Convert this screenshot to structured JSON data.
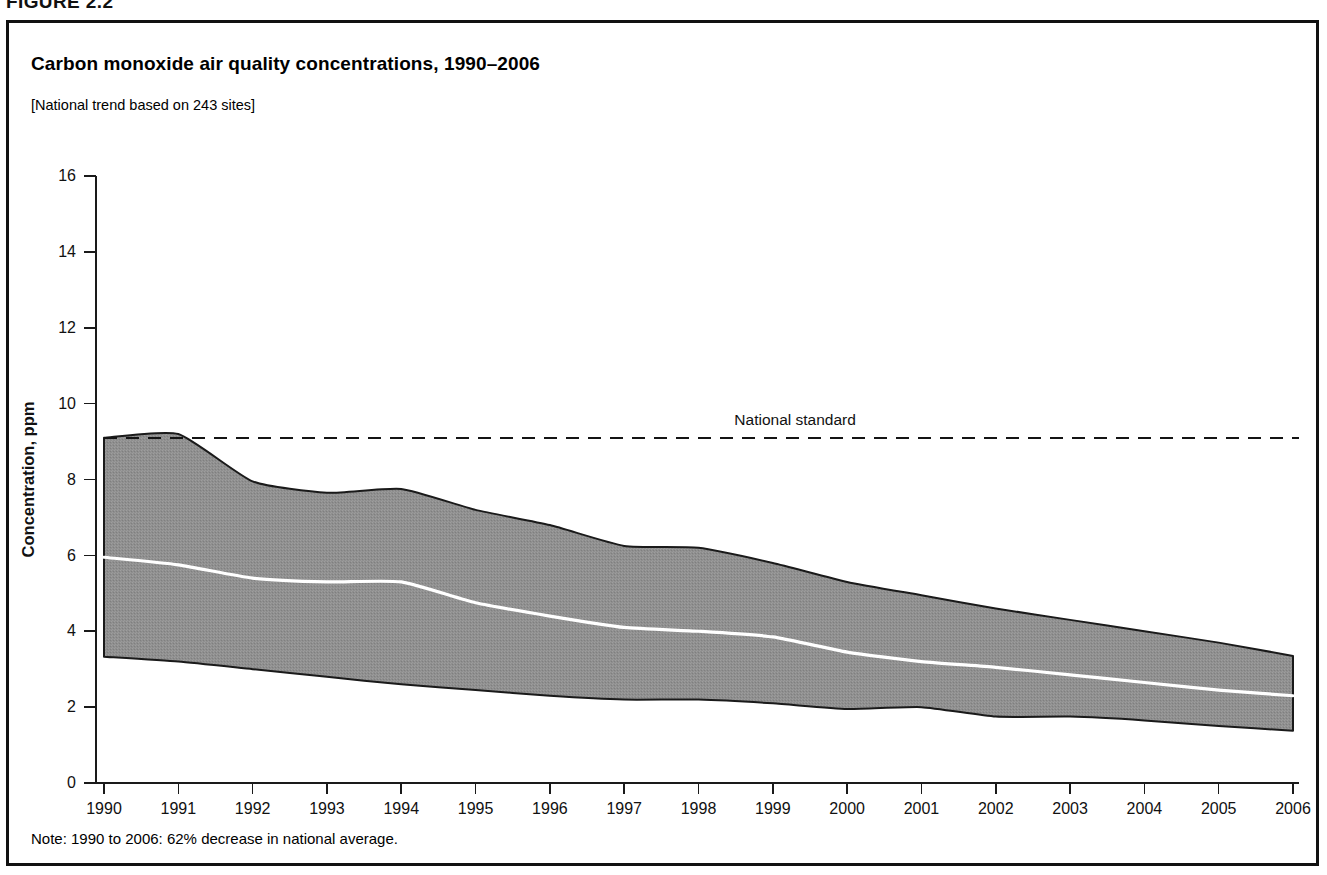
{
  "figure": {
    "label": "FIGURE 2.2",
    "title": "Carbon monoxide air quality concentrations, 1990–2006",
    "subtitle": "[National trend based on 243 sites]",
    "note": "Note: 1990 to 2006: 62% decrease in national average."
  },
  "colors": {
    "frame": "#111111",
    "band_fill": "#8c8c8c",
    "band_stroke": "#1a1a1a",
    "mean_line": "#ffffff",
    "standard_line": "#141414",
    "text": "#000000"
  },
  "chart_data": {
    "type": "area",
    "title": "Carbon monoxide air quality concentrations, 1990–2006",
    "subtitle": "[National trend based on 243 sites]",
    "xlabel": "",
    "ylabel": "Concentration, ppm",
    "ylim": [
      0,
      16
    ],
    "ytick_step": 2,
    "yticks": [
      0,
      2,
      4,
      6,
      8,
      10,
      12,
      14,
      16
    ],
    "xlim": [
      1990,
      2006
    ],
    "grid": false,
    "legend": "none",
    "categories": [
      "1990",
      "1991",
      "1992",
      "1993",
      "1994",
      "1995",
      "1996",
      "1997",
      "1998",
      "1999",
      "2000",
      "2001",
      "2002",
      "2003",
      "2004",
      "2005",
      "2006"
    ],
    "x": [
      1990,
      1991,
      1992,
      1993,
      1994,
      1995,
      1996,
      1997,
      1998,
      1999,
      2000,
      2001,
      2002,
      2003,
      2004,
      2005,
      2006
    ],
    "series": [
      {
        "name": "90th percentile (upper bound)",
        "values": [
          9.1,
          9.2,
          7.95,
          7.65,
          7.75,
          7.2,
          6.8,
          6.25,
          6.2,
          5.8,
          5.3,
          4.95,
          4.6,
          4.3,
          4.0,
          3.7,
          3.35
        ]
      },
      {
        "name": "National average (mean)",
        "values": [
          5.95,
          5.75,
          5.4,
          5.3,
          5.3,
          4.75,
          4.4,
          4.1,
          4.0,
          3.85,
          3.45,
          3.2,
          3.05,
          2.85,
          2.65,
          2.45,
          2.3
        ]
      },
      {
        "name": "10th percentile (lower bound)",
        "values": [
          3.33,
          3.2,
          3.0,
          2.8,
          2.6,
          2.45,
          2.3,
          2.2,
          2.2,
          2.1,
          1.95,
          2.0,
          1.75,
          1.75,
          1.65,
          1.5,
          1.38
        ]
      }
    ],
    "annotations": [
      {
        "name": "national-standard",
        "label": "National standard",
        "value": 9.1,
        "style": "dashed-horizontal",
        "label_x": 1999.3
      }
    ],
    "note": "Note: 1990 to 2006: 62% decrease in national average."
  }
}
